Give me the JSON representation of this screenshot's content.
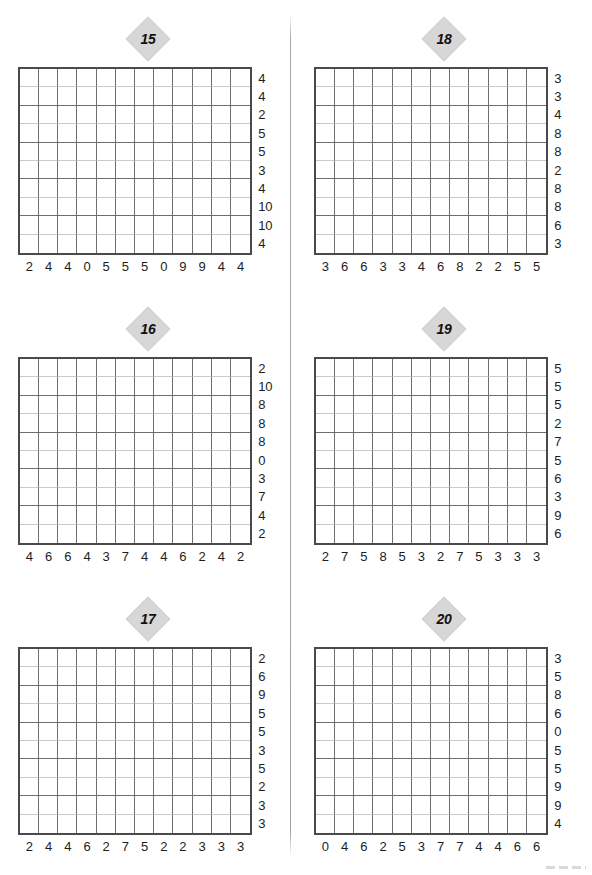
{
  "page": {
    "layout": "two-column puzzle worksheet",
    "divider_color": "#a8a8a8",
    "badge_color": "#d7d7d7",
    "grid_border_color": "#4a4a4a",
    "grid_line_color": "#6e6e6e"
  },
  "puzzles": [
    {
      "number": "15",
      "cols": 12,
      "rows": 10,
      "column_clues": [
        "2",
        "4",
        "4",
        "0",
        "5",
        "5",
        "5",
        "0",
        "9",
        "9",
        "4",
        "4"
      ],
      "row_clues": [
        "4",
        "4",
        "2",
        "5",
        "5",
        "3",
        "4",
        "10",
        "10",
        "4"
      ]
    },
    {
      "number": "18",
      "cols": 12,
      "rows": 10,
      "column_clues": [
        "3",
        "6",
        "6",
        "3",
        "3",
        "4",
        "6",
        "8",
        "2",
        "2",
        "5",
        "5"
      ],
      "row_clues": [
        "3",
        "3",
        "4",
        "8",
        "8",
        "2",
        "8",
        "8",
        "6",
        "3"
      ]
    },
    {
      "number": "16",
      "cols": 12,
      "rows": 10,
      "column_clues": [
        "4",
        "6",
        "6",
        "4",
        "3",
        "7",
        "4",
        "4",
        "6",
        "2",
        "4",
        "2"
      ],
      "row_clues": [
        "2",
        "10",
        "8",
        "8",
        "8",
        "0",
        "3",
        "7",
        "4",
        "2"
      ]
    },
    {
      "number": "19",
      "cols": 12,
      "rows": 10,
      "column_clues": [
        "2",
        "7",
        "5",
        "8",
        "5",
        "3",
        "2",
        "7",
        "5",
        "3",
        "3",
        "3"
      ],
      "row_clues": [
        "5",
        "5",
        "5",
        "2",
        "7",
        "5",
        "6",
        "3",
        "9",
        "6"
      ]
    },
    {
      "number": "17",
      "cols": 12,
      "rows": 10,
      "column_clues": [
        "2",
        "4",
        "4",
        "6",
        "2",
        "7",
        "5",
        "2",
        "2",
        "3",
        "3",
        "3"
      ],
      "row_clues": [
        "2",
        "6",
        "9",
        "5",
        "5",
        "3",
        "5",
        "2",
        "3",
        "3"
      ]
    },
    {
      "number": "20",
      "cols": 12,
      "rows": 10,
      "column_clues": [
        "0",
        "4",
        "6",
        "2",
        "5",
        "3",
        "7",
        "7",
        "4",
        "4",
        "6",
        "6"
      ],
      "row_clues": [
        "3",
        "5",
        "8",
        "6",
        "0",
        "5",
        "5",
        "9",
        "9",
        "4"
      ]
    }
  ]
}
